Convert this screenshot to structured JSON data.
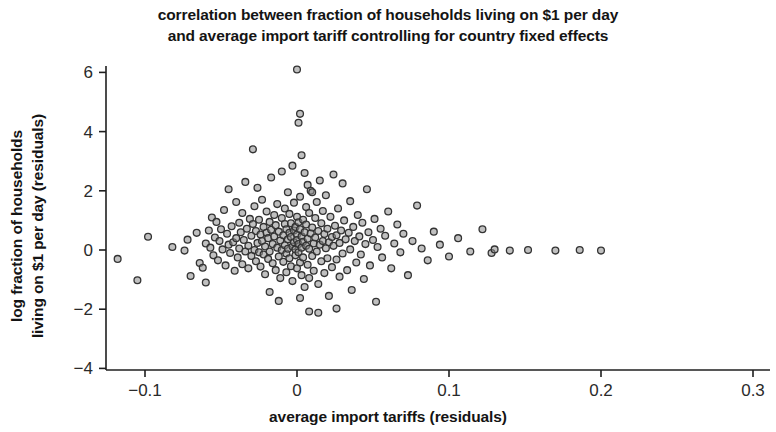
{
  "chart_data": {
    "type": "scatter",
    "title": "correlation between fraction of households living on $1 per day and average import tariff controlling for country fixed effects",
    "title_lines": [
      "correlation between fraction of households living on $1 per day",
      "and average import tariff controlling for country fixed effects"
    ],
    "xlabel": "average import tariffs (residuals)",
    "ylabel": "log fraction of households living on $1 per day (residuals)",
    "ylabel_lines": [
      "log fraction of households",
      "living on $1 per day (residuals)"
    ],
    "xlim": [
      -0.125,
      0.305
    ],
    "ylim": [
      -4.4,
      6.6
    ],
    "xticks": [
      -0.1,
      0,
      0.1,
      0.2,
      0.3
    ],
    "xtick_labels": [
      "−0.1",
      "0",
      "0.1",
      "0.2",
      "0.3"
    ],
    "yticks": [
      -4,
      -2,
      0,
      2,
      4,
      6
    ],
    "ytick_labels": [
      "−4",
      "−2",
      "0",
      "2",
      "4",
      "6"
    ],
    "grid": false,
    "legend": "none",
    "marker": {
      "shape": "circle-open",
      "size_px": 8,
      "fill": "#8c8c8c",
      "stroke": "#333333",
      "stroke_width": 1.3
    },
    "axis_color": "#1f1f1f",
    "background": "#ffffff",
    "n_points": 232,
    "points": [
      [
        -0.118,
        -0.3
      ],
      [
        -0.105,
        -1.02
      ],
      [
        -0.098,
        0.45
      ],
      [
        -0.082,
        0.1
      ],
      [
        -0.074,
        -0.02
      ],
      [
        -0.072,
        0.35
      ],
      [
        -0.066,
        0.58
      ],
      [
        -0.064,
        -0.44
      ],
      [
        -0.062,
        -0.6
      ],
      [
        -0.06,
        0.22
      ],
      [
        -0.058,
        0.66
      ],
      [
        -0.057,
        0.08
      ],
      [
        -0.056,
        1.1
      ],
      [
        -0.055,
        -0.18
      ],
      [
        -0.054,
        0.42
      ],
      [
        -0.053,
        0.95
      ],
      [
        -0.052,
        -0.35
      ],
      [
        -0.051,
        0.3
      ],
      [
        -0.05,
        0.7
      ],
      [
        -0.049,
        0.02
      ],
      [
        -0.048,
        1.35
      ],
      [
        -0.047,
        -0.52
      ],
      [
        -0.046,
        0.55
      ],
      [
        -0.045,
        0.18
      ],
      [
        -0.045,
        2.05
      ],
      [
        -0.044,
        -0.1
      ],
      [
        -0.043,
        0.8
      ],
      [
        -0.042,
        0.26
      ],
      [
        -0.041,
        -0.7
      ],
      [
        -0.04,
        1.62
      ],
      [
        -0.04,
        0.4
      ],
      [
        -0.039,
        -0.25
      ],
      [
        -0.038,
        0.92
      ],
      [
        -0.038,
        0.05
      ],
      [
        -0.037,
        0.6
      ],
      [
        -0.036,
        -0.48
      ],
      [
        -0.036,
        1.25
      ],
      [
        -0.035,
        0.34
      ],
      [
        -0.034,
        -0.05
      ],
      [
        -0.034,
        2.3
      ],
      [
        -0.033,
        0.72
      ],
      [
        -0.032,
        0.14
      ],
      [
        -0.032,
        -0.62
      ],
      [
        -0.031,
        1.05
      ],
      [
        -0.03,
        0.48
      ],
      [
        -0.03,
        -0.2
      ],
      [
        -0.029,
        0.88
      ],
      [
        -0.029,
        3.4
      ],
      [
        -0.028,
        0.0
      ],
      [
        -0.028,
        1.48
      ],
      [
        -0.027,
        -0.38
      ],
      [
        -0.027,
        0.64
      ],
      [
        -0.026,
        0.24
      ],
      [
        -0.026,
        2.1
      ],
      [
        -0.025,
        -0.08
      ],
      [
        -0.025,
        1.02
      ],
      [
        -0.024,
        0.52
      ],
      [
        -0.024,
        -0.56
      ],
      [
        -0.023,
        0.3
      ],
      [
        -0.023,
        1.7
      ],
      [
        -0.022,
        -0.15
      ],
      [
        -0.022,
        0.78
      ],
      [
        -0.021,
        0.12
      ],
      [
        -0.021,
        -0.82
      ],
      [
        -0.02,
        0.58
      ],
      [
        -0.02,
        1.3
      ],
      [
        -0.019,
        -0.3
      ],
      [
        -0.019,
        0.4
      ],
      [
        -0.018,
        0.95
      ],
      [
        -0.018,
        -0.05
      ],
      [
        -0.017,
        2.45
      ],
      [
        -0.017,
        0.68
      ],
      [
        -0.016,
        -0.45
      ],
      [
        -0.016,
        0.2
      ],
      [
        -0.015,
        1.18
      ],
      [
        -0.015,
        0.46
      ],
      [
        -0.014,
        -0.68
      ],
      [
        -0.014,
        0.84
      ],
      [
        -0.013,
        0.08
      ],
      [
        -0.013,
        1.55
      ],
      [
        -0.012,
        -0.22
      ],
      [
        -0.012,
        0.62
      ],
      [
        -0.011,
        0.32
      ],
      [
        -0.011,
        -0.95
      ],
      [
        -0.01,
        1.08
      ],
      [
        -0.01,
        0.0
      ],
      [
        -0.01,
        2.65
      ],
      [
        -0.009,
        0.5
      ],
      [
        -0.009,
        -0.4
      ],
      [
        -0.008,
        0.88
      ],
      [
        -0.008,
        0.16
      ],
      [
        -0.008,
        1.4
      ],
      [
        -0.007,
        -0.12
      ],
      [
        -0.007,
        0.7
      ],
      [
        -0.007,
        -0.75
      ],
      [
        -0.006,
        0.36
      ],
      [
        -0.006,
        1.95
      ],
      [
        -0.006,
        0.04
      ],
      [
        -0.005,
        0.58
      ],
      [
        -0.005,
        -0.28
      ],
      [
        -0.005,
        1.22
      ],
      [
        -0.004,
        0.44
      ],
      [
        -0.004,
        -0.55
      ],
      [
        -0.004,
        0.9
      ],
      [
        -0.003,
        0.12
      ],
      [
        -0.003,
        2.85
      ],
      [
        -0.003,
        -1.05
      ],
      [
        -0.002,
        0.66
      ],
      [
        -0.002,
        0.26
      ],
      [
        -0.002,
        1.6
      ],
      [
        -0.001,
        -0.18
      ],
      [
        -0.001,
        0.78
      ],
      [
        -0.001,
        0.02
      ],
      [
        0.0,
        0.52
      ],
      [
        0.0,
        -0.62
      ],
      [
        0.0,
        1.12
      ],
      [
        0.0,
        6.1
      ],
      [
        0.0,
        0.34
      ],
      [
        0.001,
        -0.08
      ],
      [
        0.001,
        0.94
      ],
      [
        0.001,
        4.3
      ],
      [
        0.001,
        0.2
      ],
      [
        0.002,
        -0.42
      ],
      [
        0.002,
        0.7
      ],
      [
        0.002,
        4.6
      ],
      [
        0.002,
        1.8
      ],
      [
        0.003,
        0.08
      ],
      [
        0.003,
        0.46
      ],
      [
        0.003,
        -0.85
      ],
      [
        0.003,
        3.2
      ],
      [
        0.004,
        1.02
      ],
      [
        0.004,
        0.28
      ],
      [
        0.004,
        -0.25
      ],
      [
        0.005,
        0.6
      ],
      [
        0.005,
        2.6
      ],
      [
        0.005,
        -1.25
      ],
      [
        0.006,
        0.14
      ],
      [
        0.006,
        0.86
      ],
      [
        0.006,
        1.45
      ],
      [
        0.007,
        -0.5
      ],
      [
        0.007,
        0.38
      ],
      [
        0.007,
        2.2
      ],
      [
        0.008,
        0.04
      ],
      [
        0.008,
        1.25
      ],
      [
        0.008,
        -0.95
      ],
      [
        0.009,
        0.56
      ],
      [
        0.009,
        2.0
      ],
      [
        0.01,
        -0.2
      ],
      [
        0.01,
        0.76
      ],
      [
        0.01,
        1.95
      ],
      [
        0.011,
        0.22
      ],
      [
        0.011,
        -0.7
      ],
      [
        0.012,
        1.08
      ],
      [
        0.012,
        0.42
      ],
      [
        0.013,
        -0.05
      ],
      [
        0.013,
        1.62
      ],
      [
        0.014,
        0.64
      ],
      [
        0.014,
        -1.15
      ],
      [
        0.015,
        0.18
      ],
      [
        0.015,
        2.35
      ],
      [
        0.016,
        0.9
      ],
      [
        0.016,
        -0.38
      ],
      [
        0.017,
        0.3
      ],
      [
        0.017,
        1.32
      ],
      [
        0.018,
        -0.78
      ],
      [
        0.018,
        0.54
      ],
      [
        0.019,
        0.06
      ],
      [
        0.019,
        1.85
      ],
      [
        0.02,
        -0.28
      ],
      [
        0.02,
        0.72
      ],
      [
        0.021,
        0.26
      ],
      [
        0.021,
        -1.55
      ],
      [
        0.022,
        1.12
      ],
      [
        0.023,
        0.44
      ],
      [
        0.023,
        -0.58
      ],
      [
        0.024,
        0.14
      ],
      [
        0.024,
        2.55
      ],
      [
        0.025,
        0.82
      ],
      [
        0.026,
        -0.32
      ],
      [
        0.026,
        0.5
      ],
      [
        0.027,
        1.4
      ],
      [
        0.028,
        -0.9
      ],
      [
        0.028,
        0.24
      ],
      [
        0.029,
        0.66
      ],
      [
        0.03,
        -0.12
      ],
      [
        0.03,
        2.25
      ],
      [
        0.031,
        1.0
      ],
      [
        0.032,
        0.36
      ],
      [
        0.033,
        -0.68
      ],
      [
        0.034,
        0.58
      ],
      [
        0.035,
        1.65
      ],
      [
        0.035,
        0.02
      ],
      [
        0.036,
        -1.35
      ],
      [
        0.037,
        0.78
      ],
      [
        0.038,
        0.3
      ],
      [
        0.039,
        -0.42
      ],
      [
        0.04,
        1.18
      ],
      [
        0.041,
        0.46
      ],
      [
        0.042,
        -0.15
      ],
      [
        0.043,
        0.92
      ],
      [
        0.044,
        -0.98
      ],
      [
        0.045,
        0.2
      ],
      [
        0.046,
        2.05
      ],
      [
        0.047,
        0.6
      ],
      [
        0.048,
        -0.52
      ],
      [
        0.05,
        0.34
      ],
      [
        0.051,
        1.05
      ],
      [
        0.052,
        -1.75
      ],
      [
        0.053,
        0.1
      ],
      [
        0.055,
        0.72
      ],
      [
        0.056,
        -0.25
      ],
      [
        0.058,
        0.48
      ],
      [
        0.06,
        1.3
      ],
      [
        0.062,
        -0.62
      ],
      [
        0.064,
        0.22
      ],
      [
        0.066,
        0.86
      ],
      [
        0.068,
        -0.08
      ],
      [
        0.07,
        0.55
      ],
      [
        0.073,
        -0.85
      ],
      [
        0.076,
        0.3
      ],
      [
        0.079,
        1.5
      ],
      [
        0.082,
        0.05
      ],
      [
        0.086,
        -0.35
      ],
      [
        0.09,
        0.62
      ],
      [
        0.094,
        0.18
      ],
      [
        0.1,
        -0.22
      ],
      [
        0.106,
        0.4
      ],
      [
        0.114,
        -0.05
      ],
      [
        0.122,
        0.7
      ],
      [
        0.128,
        -0.1
      ],
      [
        0.13,
        0.02
      ],
      [
        0.14,
        -0.02
      ],
      [
        0.152,
        0.0
      ],
      [
        0.17,
        -0.02
      ],
      [
        0.186,
        0.0
      ],
      [
        0.2,
        -0.02
      ],
      [
        -0.07,
        -0.88
      ],
      [
        -0.06,
        -1.1
      ],
      [
        -0.012,
        -1.72
      ],
      [
        0.008,
        -2.08
      ],
      [
        0.014,
        -2.12
      ],
      [
        0.026,
        -1.98
      ],
      [
        0.002,
        -1.62
      ],
      [
        -0.018,
        -1.42
      ]
    ]
  }
}
